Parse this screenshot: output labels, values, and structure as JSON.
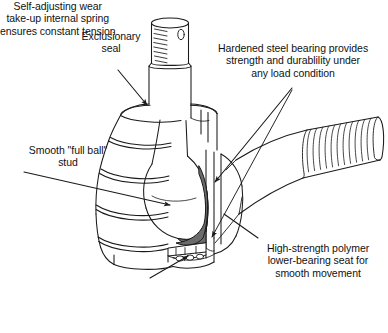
{
  "figure": {
    "type": "technical-line-drawing-cutaway",
    "background_color": "#ffffff",
    "line_color": "#1a1a1a",
    "bearing_fill_color": "#6b6b6b",
    "seat_fill_color": "#8a8a8a"
  },
  "callouts": {
    "exclusionary_seal": {
      "text": "Exclusionary\nseal",
      "align": "center",
      "points_to": "seal-top"
    },
    "hardened_bearing": {
      "text": "Hardened steel bearing provides\nstrength and durablility under\nany load condition",
      "align": "center",
      "points_to": "hardened-steel-bearing"
    },
    "full_ball_stud": {
      "text": "Smooth \"full ball\"\nstud",
      "align": "center",
      "points_to": "ball-stud"
    },
    "polymer_seat": {
      "text": "High-strength polymer\nlower-bearing seat for\nsmooth movement",
      "align": "center",
      "points_to": "lower-bearing-seat"
    },
    "internal_spring": {
      "text": "Self-adjusting wear\ntake-up internal spring\nensures constant tension",
      "align": "center",
      "points_to": "internal-spring"
    }
  },
  "parts": [
    {
      "id": "threaded-stud",
      "name": "Threaded stud top"
    },
    {
      "id": "exclusionary-seal",
      "name": "Exclusionary seal / bellows boot"
    },
    {
      "id": "ball-stud",
      "name": "Smooth full ball stud"
    },
    {
      "id": "hardened-steel-bearing",
      "name": "Hardened steel bearing"
    },
    {
      "id": "lower-bearing-seat",
      "name": "High-strength polymer lower-bearing seat"
    },
    {
      "id": "internal-spring",
      "name": "Self-adjusting wear take-up internal spring"
    },
    {
      "id": "tie-rod-arm",
      "name": "Threaded tie rod arm"
    },
    {
      "id": "housing",
      "name": "Joint housing"
    }
  ]
}
